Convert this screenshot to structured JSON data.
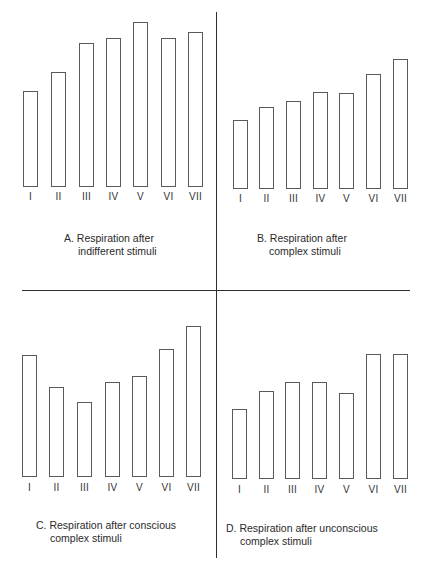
{
  "chart_data": [
    {
      "type": "bar",
      "panel": "A",
      "title": "A. Respiration after indifferent stimuli",
      "caption_lines": [
        "A. Respiration after",
        "indifferent stimuli"
      ],
      "categories": [
        "I",
        "II",
        "III",
        "IV",
        "V",
        "VI",
        "VII"
      ],
      "values": [
        96,
        115,
        144,
        149,
        165,
        149,
        155
      ],
      "xlabel": "",
      "ylabel": "",
      "grid": false,
      "legend": "none",
      "bar_style": "outlined"
    },
    {
      "type": "bar",
      "panel": "B",
      "title": "B. Respiration after complex stimuli",
      "caption_lines": [
        "B. Respiration after",
        "complex stimuli"
      ],
      "categories": [
        "I",
        "II",
        "III",
        "IV",
        "V",
        "VI",
        "VII"
      ],
      "values": [
        69,
        82,
        88,
        97,
        96,
        115,
        130
      ],
      "xlabel": "",
      "ylabel": "",
      "grid": false,
      "legend": "none",
      "bar_style": "outlined"
    },
    {
      "type": "bar",
      "panel": "C",
      "title": "C. Respiration after conscious complex stimuli",
      "caption_lines": [
        "C. Respiration after conscious",
        "complex stimuli"
      ],
      "categories": [
        "I",
        "II",
        "III",
        "IV",
        "V",
        "VI",
        "VII"
      ],
      "values": [
        122,
        90,
        75,
        95,
        101,
        128,
        151
      ],
      "xlabel": "",
      "ylabel": "",
      "grid": false,
      "legend": "none",
      "bar_style": "outlined"
    },
    {
      "type": "bar",
      "panel": "D",
      "title": "D. Respiration after unconscious complex stimuli",
      "caption_lines": [
        "D. Respiration after unconscious",
        "complex stimuli"
      ],
      "categories": [
        "I",
        "II",
        "III",
        "IV",
        "V",
        "VI",
        "VII"
      ],
      "values": [
        70,
        88,
        97,
        97,
        86,
        125,
        125
      ],
      "xlabel": "",
      "ylabel": "",
      "grid": false,
      "legend": "none",
      "bar_style": "outlined"
    }
  ],
  "colors": {
    "bar_outline": "#5a5a5a",
    "bar_fill": "#ffffff",
    "divider": "#2e2e2e",
    "text": "#2a2a2a"
  }
}
